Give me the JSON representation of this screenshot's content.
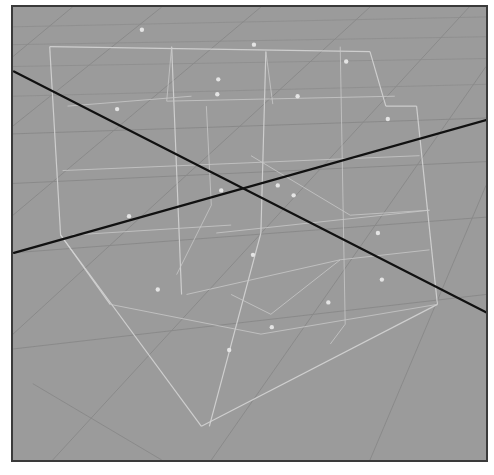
{
  "viewport": {
    "name": "3d-viewport-perspective",
    "background_color": "#9b9b9b",
    "border_color": "#3a3a3a",
    "axis_color": "#111111",
    "cage_color": "#d4d4d4",
    "point_color": "#e4e4e4",
    "size": [
      477,
      457
    ]
  },
  "scene": {
    "axes": [
      {
        "name": "x-axis-line",
        "p1": [
          1,
          65
        ],
        "p2": [
          477,
          308
        ]
      },
      {
        "name": "z-axis-line",
        "p1": [
          1,
          248
        ],
        "p2": [
          477,
          114
        ]
      }
    ],
    "grid_lines": [
      [
        [
          0,
          20
        ],
        [
          477,
          10
        ]
      ],
      [
        [
          0,
          38
        ],
        [
          477,
          30
        ]
      ],
      [
        [
          0,
          60
        ],
        [
          477,
          52
        ]
      ],
      [
        [
          0,
          90
        ],
        [
          477,
          78
        ]
      ],
      [
        [
          0,
          128
        ],
        [
          477,
          112
        ]
      ],
      [
        [
          0,
          178
        ],
        [
          477,
          156
        ]
      ],
      [
        [
          0,
          248
        ],
        [
          477,
          212
        ]
      ],
      [
        [
          0,
          345
        ],
        [
          477,
          290
        ]
      ],
      [
        [
          60,
          0
        ],
        [
          0,
          50
        ]
      ],
      [
        [
          150,
          0
        ],
        [
          0,
          120
        ]
      ],
      [
        [
          250,
          0
        ],
        [
          0,
          210
        ]
      ],
      [
        [
          360,
          0
        ],
        [
          0,
          330
        ]
      ],
      [
        [
          460,
          0
        ],
        [
          40,
          457
        ]
      ],
      [
        [
          477,
          60
        ],
        [
          200,
          457
        ]
      ],
      [
        [
          477,
          180
        ],
        [
          360,
          457
        ]
      ],
      [
        [
          20,
          380
        ],
        [
          150,
          457
        ]
      ]
    ],
    "cage_edges": [
      [
        [
          37,
          40
        ],
        [
          360,
          45
        ]
      ],
      [
        [
          37,
          40
        ],
        [
          48,
          230
        ]
      ],
      [
        [
          360,
          45
        ],
        [
          376,
          100
        ]
      ],
      [
        [
          48,
          230
        ],
        [
          190,
          423
        ]
      ],
      [
        [
          190,
          423
        ],
        [
          428,
          300
        ]
      ],
      [
        [
          428,
          300
        ],
        [
          407,
          100
        ]
      ],
      [
        [
          376,
          100
        ],
        [
          407,
          100
        ]
      ],
      [
        [
          48,
          230
        ],
        [
          98,
          300
        ]
      ],
      [
        [
          160,
          40
        ],
        [
          170,
          290
        ]
      ],
      [
        [
          255,
          45
        ],
        [
          250,
          228
        ]
      ],
      [
        [
          250,
          228
        ],
        [
          198,
          423
        ]
      ],
      [
        [
          155,
          95
        ],
        [
          385,
          90
        ]
      ],
      [
        [
          160,
          40
        ],
        [
          155,
          95
        ]
      ],
      [
        [
          255,
          45
        ],
        [
          262,
          98
        ]
      ],
      [
        [
          55,
          100
        ],
        [
          180,
          90
        ]
      ],
      [
        [
          50,
          165
        ],
        [
          410,
          150
        ]
      ],
      [
        [
          60,
          230
        ],
        [
          220,
          220
        ]
      ],
      [
        [
          205,
          228
        ],
        [
          420,
          205
        ]
      ],
      [
        [
          98,
          300
        ],
        [
          250,
          330
        ]
      ],
      [
        [
          250,
          330
        ],
        [
          428,
          300
        ]
      ],
      [
        [
          175,
          290
        ],
        [
          330,
          255
        ]
      ],
      [
        [
          330,
          255
        ],
        [
          420,
          245
        ]
      ],
      [
        [
          330,
          40
        ],
        [
          335,
          320
        ]
      ],
      [
        [
          335,
          320
        ],
        [
          320,
          340
        ]
      ],
      [
        [
          195,
          100
        ],
        [
          200,
          200
        ]
      ],
      [
        [
          200,
          200
        ],
        [
          165,
          270
        ]
      ],
      [
        [
          240,
          150
        ],
        [
          340,
          210
        ]
      ],
      [
        [
          340,
          210
        ],
        [
          420,
          205
        ]
      ],
      [
        [
          220,
          290
        ],
        [
          260,
          310
        ]
      ],
      [
        [
          260,
          310
        ],
        [
          330,
          255
        ]
      ]
    ],
    "control_points": [
      [
        130,
        23
      ],
      [
        243,
        38
      ],
      [
        336,
        55
      ],
      [
        207,
        73
      ],
      [
        206,
        88
      ],
      [
        287,
        90
      ],
      [
        105,
        103
      ],
      [
        378,
        113
      ],
      [
        210,
        185
      ],
      [
        267,
        180
      ],
      [
        283,
        190
      ],
      [
        117,
        211
      ],
      [
        368,
        228
      ],
      [
        242,
        250
      ],
      [
        146,
        285
      ],
      [
        372,
        275
      ],
      [
        318,
        298
      ],
      [
        261,
        323
      ],
      [
        218,
        346
      ]
    ]
  }
}
